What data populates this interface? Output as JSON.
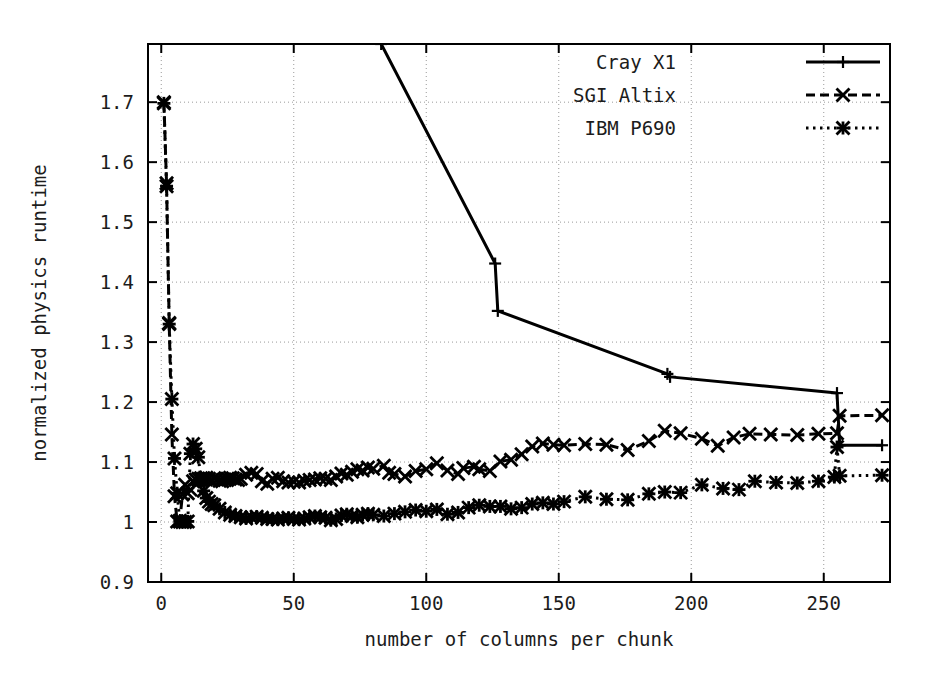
{
  "chart_data": {
    "type": "line",
    "title": "",
    "xlabel": "number of columns per chunk",
    "ylabel": "normalized physics runtime",
    "xlim": [
      -5,
      275
    ],
    "ylim": [
      0.9,
      1.797
    ],
    "xticks": [
      0,
      50,
      100,
      150,
      200,
      250
    ],
    "yticks": [
      0.9,
      1,
      1.1,
      1.2,
      1.3,
      1.4,
      1.5,
      1.6,
      1.7
    ],
    "xtick_labels": [
      "0",
      "50",
      "100",
      "150",
      "200",
      "250"
    ],
    "ytick_labels": [
      "0.9",
      "1",
      "1.1",
      "1.2",
      "1.3",
      "1.4",
      "1.5",
      "1.6",
      "1.7"
    ],
    "grid": true,
    "legend_position": "top-right",
    "series": [
      {
        "name": "Cray X1",
        "style": "solid",
        "marker": "plus",
        "color": "#000000",
        "points": [
          [
            83,
            1.797
          ],
          [
            126,
            1.431
          ],
          [
            127,
            1.352
          ],
          [
            191,
            1.247
          ],
          [
            192,
            1.242
          ],
          [
            255,
            1.215
          ],
          [
            256,
            1.128
          ],
          [
            272,
            1.128
          ]
        ]
      },
      {
        "name": "SGI Altix",
        "style": "dashed",
        "marker": "cross",
        "color": "#000000",
        "points": [
          [
            1,
            1.7
          ],
          [
            2,
            1.565
          ],
          [
            3,
            1.332
          ],
          [
            4,
            1.146
          ],
          [
            5,
            1.043
          ],
          [
            6,
            1.001
          ],
          [
            7,
            1.002
          ],
          [
            8,
            1.046
          ],
          [
            9,
            1.062
          ],
          [
            10,
            1.048
          ],
          [
            11,
            1.054
          ],
          [
            12,
            1.068
          ],
          [
            13,
            1.071
          ],
          [
            14,
            1.072
          ],
          [
            15,
            1.073
          ],
          [
            16,
            1.072
          ],
          [
            17,
            1.074
          ],
          [
            18,
            1.072
          ],
          [
            19,
            1.07
          ],
          [
            20,
            1.073
          ],
          [
            21,
            1.071
          ],
          [
            22,
            1.069
          ],
          [
            23,
            1.068
          ],
          [
            24,
            1.07
          ],
          [
            25,
            1.072
          ],
          [
            26,
            1.074
          ],
          [
            27,
            1.073
          ],
          [
            28,
            1.071
          ],
          [
            29,
            1.07
          ],
          [
            30,
            1.072
          ],
          [
            32,
            1.079
          ],
          [
            34,
            1.082
          ],
          [
            36,
            1.08
          ],
          [
            38,
            1.068
          ],
          [
            40,
            1.064
          ],
          [
            42,
            1.072
          ],
          [
            44,
            1.074
          ],
          [
            46,
            1.068
          ],
          [
            48,
            1.066
          ],
          [
            50,
            1.067
          ],
          [
            52,
            1.066
          ],
          [
            54,
            1.069
          ],
          [
            56,
            1.07
          ],
          [
            58,
            1.071
          ],
          [
            60,
            1.073
          ],
          [
            62,
            1.072
          ],
          [
            64,
            1.07
          ],
          [
            66,
            1.076
          ],
          [
            68,
            1.081
          ],
          [
            70,
            1.079
          ],
          [
            72,
            1.084
          ],
          [
            74,
            1.088
          ],
          [
            76,
            1.086
          ],
          [
            78,
            1.091
          ],
          [
            80,
            1.089
          ],
          [
            84,
            1.094
          ],
          [
            86,
            1.082
          ],
          [
            88,
            1.08
          ],
          [
            92,
            1.076
          ],
          [
            96,
            1.085
          ],
          [
            100,
            1.088
          ],
          [
            104,
            1.098
          ],
          [
            108,
            1.086
          ],
          [
            112,
            1.08
          ],
          [
            114,
            1.09
          ],
          [
            118,
            1.092
          ],
          [
            120,
            1.088
          ],
          [
            124,
            1.085
          ],
          [
            128,
            1.101
          ],
          [
            132,
            1.104
          ],
          [
            136,
            1.113
          ],
          [
            140,
            1.126
          ],
          [
            144,
            1.131
          ],
          [
            148,
            1.129
          ],
          [
            152,
            1.128
          ],
          [
            160,
            1.13
          ],
          [
            168,
            1.129
          ],
          [
            176,
            1.12
          ],
          [
            184,
            1.135
          ],
          [
            190,
            1.152
          ],
          [
            196,
            1.148
          ],
          [
            204,
            1.139
          ],
          [
            210,
            1.127
          ],
          [
            216,
            1.141
          ],
          [
            222,
            1.147
          ],
          [
            230,
            1.146
          ],
          [
            240,
            1.145
          ],
          [
            248,
            1.147
          ],
          [
            255,
            1.148
          ],
          [
            256,
            1.177
          ],
          [
            272,
            1.178
          ]
        ]
      },
      {
        "name": "IBM P690",
        "style": "dotted",
        "marker": "star",
        "color": "#000000",
        "points": [
          [
            1,
            1.698
          ],
          [
            2,
            1.56
          ],
          [
            3,
            1.33
          ],
          [
            4,
            1.205
          ],
          [
            5,
            1.106
          ],
          [
            6,
            1.048
          ],
          [
            7,
            1.001
          ],
          [
            8,
            1.0
          ],
          [
            9,
            1.0
          ],
          [
            10,
            1.001
          ],
          [
            11,
            1.114
          ],
          [
            12,
            1.13
          ],
          [
            13,
            1.122
          ],
          [
            14,
            1.108
          ],
          [
            15,
            1.07
          ],
          [
            16,
            1.052
          ],
          [
            17,
            1.04
          ],
          [
            18,
            1.034
          ],
          [
            19,
            1.03
          ],
          [
            20,
            1.028
          ],
          [
            22,
            1.022
          ],
          [
            24,
            1.016
          ],
          [
            26,
            1.012
          ],
          [
            28,
            1.01
          ],
          [
            30,
            1.008
          ],
          [
            32,
            1.006
          ],
          [
            34,
            1.008
          ],
          [
            36,
            1.009
          ],
          [
            38,
            1.007
          ],
          [
            40,
            1.005
          ],
          [
            42,
            1.005
          ],
          [
            44,
            1.004
          ],
          [
            46,
            1.006
          ],
          [
            48,
            1.007
          ],
          [
            50,
            1.005
          ],
          [
            52,
            1.004
          ],
          [
            54,
            1.006
          ],
          [
            56,
            1.008
          ],
          [
            58,
            1.01
          ],
          [
            60,
            1.008
          ],
          [
            62,
            1.007
          ],
          [
            64,
            1.003
          ],
          [
            66,
            1.005
          ],
          [
            68,
            1.011
          ],
          [
            70,
            1.013
          ],
          [
            72,
            1.01
          ],
          [
            74,
            1.008
          ],
          [
            76,
            1.012
          ],
          [
            78,
            1.014
          ],
          [
            80,
            1.012
          ],
          [
            84,
            1.01
          ],
          [
            88,
            1.014
          ],
          [
            92,
            1.017
          ],
          [
            96,
            1.02
          ],
          [
            100,
            1.018
          ],
          [
            104,
            1.021
          ],
          [
            108,
            1.013
          ],
          [
            112,
            1.016
          ],
          [
            116,
            1.024
          ],
          [
            120,
            1.028
          ],
          [
            124,
            1.026
          ],
          [
            128,
            1.026
          ],
          [
            132,
            1.022
          ],
          [
            136,
            1.024
          ],
          [
            140,
            1.03
          ],
          [
            144,
            1.032
          ],
          [
            148,
            1.03
          ],
          [
            152,
            1.034
          ],
          [
            160,
            1.042
          ],
          [
            168,
            1.038
          ],
          [
            176,
            1.037
          ],
          [
            184,
            1.047
          ],
          [
            190,
            1.05
          ],
          [
            196,
            1.049
          ],
          [
            204,
            1.062
          ],
          [
            212,
            1.056
          ],
          [
            218,
            1.054
          ],
          [
            224,
            1.068
          ],
          [
            232,
            1.066
          ],
          [
            240,
            1.065
          ],
          [
            248,
            1.068
          ],
          [
            254,
            1.075
          ],
          [
            255,
            1.125
          ],
          [
            256,
            1.077
          ],
          [
            272,
            1.078
          ]
        ]
      }
    ]
  },
  "legend": {
    "entries": [
      {
        "label": "Cray X1",
        "style": "solid",
        "marker": "plus"
      },
      {
        "label": "SGI Altix",
        "style": "dashed",
        "marker": "cross"
      },
      {
        "label": "IBM P690",
        "style": "dotted",
        "marker": "star"
      }
    ]
  },
  "colors": {
    "ink": "#000000",
    "grid": "#9a9a9a",
    "background": "#ffffff"
  }
}
